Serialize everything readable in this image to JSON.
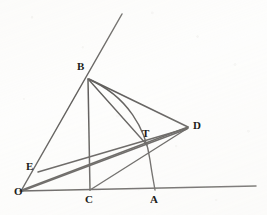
{
  "figure": {
    "medium": "pencil-on-paper-scan",
    "canvas": {
      "width": 267,
      "height": 215
    },
    "background_color": "#fdfdfc",
    "ink_color": "#262420"
  },
  "labels": [
    {
      "id": "B",
      "text": "B",
      "x": 77,
      "y": 61
    },
    {
      "id": "D",
      "text": "D",
      "x": 193,
      "y": 120
    },
    {
      "id": "T",
      "text": "T",
      "x": 142,
      "y": 128
    },
    {
      "id": "E",
      "text": "E",
      "x": 26,
      "y": 161
    },
    {
      "id": "O",
      "text": "O",
      "x": 14,
      "y": 186
    },
    {
      "id": "C",
      "text": "C",
      "x": 85,
      "y": 194
    },
    {
      "id": "A",
      "text": "A",
      "x": 150,
      "y": 194
    }
  ],
  "points": [
    {
      "id": "O",
      "x": 22,
      "y": 191,
      "label": "O",
      "role": "apex-of-angle"
    },
    {
      "id": "B",
      "x": 88,
      "y": 78,
      "label": "B",
      "role": "point-on-upper-ray"
    },
    {
      "id": "C",
      "x": 90,
      "y": 190,
      "label": "C",
      "role": "foot-on-baseline"
    },
    {
      "id": "A",
      "x": 155,
      "y": 190,
      "label": "A",
      "role": "arc-meets-baseline"
    },
    {
      "id": "D",
      "x": 188,
      "y": 127,
      "label": "D",
      "role": "right-vertex"
    },
    {
      "id": "E",
      "x": 38,
      "y": 172,
      "label": "E",
      "role": "point-on-upper-ray"
    },
    {
      "id": "T",
      "x": 145,
      "y": 143,
      "label": "T",
      "role": "intersection-point"
    }
  ],
  "segments": [
    {
      "id": "baseline",
      "from": "O",
      "to": "ray-end-right",
      "x1": 20,
      "y1": 191,
      "x2": 256,
      "y2": 186
    },
    {
      "id": "upper-ray",
      "from": "O",
      "to": "ray-end-top",
      "x1": 21,
      "y1": 191,
      "x2": 122,
      "y2": 14
    },
    {
      "id": "BC",
      "from": "B",
      "to": "C",
      "x1": 88,
      "y1": 79,
      "x2": 90,
      "y2": 190
    },
    {
      "id": "BD",
      "from": "B",
      "to": "D",
      "x1": 89,
      "y1": 79,
      "x2": 188,
      "y2": 127
    },
    {
      "id": "BT",
      "from": "B",
      "to": "T",
      "x1": 89,
      "y1": 80,
      "x2": 147,
      "y2": 145
    },
    {
      "id": "OD",
      "from": "O",
      "to": "D",
      "x1": 22,
      "y1": 190,
      "x2": 188,
      "y2": 127
    },
    {
      "id": "ED",
      "from": "E",
      "to": "D",
      "x1": 38,
      "y1": 172,
      "x2": 188,
      "y2": 128
    },
    {
      "id": "OT-extended",
      "from": "O",
      "to": "D",
      "x1": 22,
      "y1": 191,
      "x2": 187,
      "y2": 129
    },
    {
      "id": "CD",
      "from": "C",
      "to": "D",
      "x1": 90,
      "y1": 190,
      "x2": 188,
      "y2": 128
    }
  ],
  "arcs": [
    {
      "id": "arc-BA",
      "from": "B",
      "to": "A",
      "center": "C",
      "description": "circular arc from B sweeping right-downward to A, centered near C",
      "path": "M 88 79 C 128 96 146 130 150 160 C 152 174 154 184 155 190"
    }
  ]
}
